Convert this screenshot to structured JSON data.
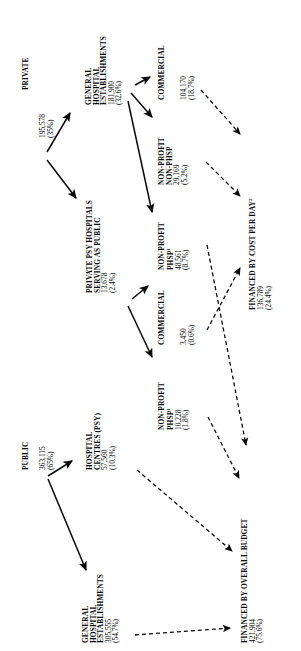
{
  "figure": {
    "type": "flow-diagram",
    "orientation": "text-rotated-90-ccw",
    "background": "#ffffff",
    "ink": "#0a0a0a"
  },
  "nodes": {
    "private": {
      "label": "PRIVATE",
      "value": "195,578",
      "percent": "(35%)"
    },
    "public": {
      "label": "PUBLIC",
      "value": "363,115",
      "percent": "(65%)"
    },
    "private_general_hospital": {
      "line1": "GENERAL",
      "line2": "HOSPITAL",
      "line3": "ESTABLISHMENTS",
      "value": "181,900",
      "percent": "(32.6%)"
    },
    "private_psy_serving_public": {
      "line1": "PRIVATE PSY HOSPITALS",
      "line2": "SERVING AS PUBLIC",
      "value": "13,678",
      "percent": "(2.4%)"
    },
    "public_hospital_centres": {
      "line1": "HOSPITAL",
      "line2": "CENTRES (PSY)",
      "value": "57,560",
      "percent": "(10.3%)"
    },
    "public_general_hospital": {
      "line1": "GENERAL",
      "line2": "HOSPITAL",
      "line3": "ESTABLISHMENTS",
      "value": "305,555",
      "percent": "(54.7%)"
    },
    "commercial_top": {
      "line1": "COMMERCIAL",
      "value": "104,170",
      "percent": "(18.7%)"
    },
    "non_profit_non_phsp": {
      "line1": "NON-PROFIT",
      "line2": "NON-PHSP",
      "value": "29,169",
      "percent": "(5.2%)"
    },
    "non_profit_phsp_upper": {
      "line1": "NON-PROFIT",
      "line2": "PHSP",
      "line2_sup": "1",
      "value": "48,561",
      "percent": "(8.7%)"
    },
    "commercial_mid": {
      "line1": "COMMERCIAL",
      "value": "3,450",
      "percent": "(0.6%)"
    },
    "non_profit_phsp_lower": {
      "line1": "NON-PROFIT",
      "line2": "PHSP",
      "line2_sup": "1",
      "value": "10,228",
      "percent": "(1.8%)"
    },
    "financed_cost_per_day": {
      "line1": "FINANCED BY COST PER DAY",
      "line1_sup": "2",
      "value": "136,789",
      "percent": "(24.4%)"
    },
    "financed_overall_budget": {
      "line1": "FINANCED BY OVERALL BUDGET",
      "value": "421,904",
      "percent": "(75.6%)"
    }
  },
  "edges": [
    {
      "name": "private-to-general-hospital",
      "style": "solid"
    },
    {
      "name": "private-to-psy-serving-public",
      "style": "solid"
    },
    {
      "name": "general-hospital-to-commercial",
      "style": "solid"
    },
    {
      "name": "general-hospital-to-non-profit-non-phsp",
      "style": "solid"
    },
    {
      "name": "general-hospital-to-non-profit-phsp",
      "style": "solid"
    },
    {
      "name": "psy-serving-public-to-commercial-mid",
      "style": "solid"
    },
    {
      "name": "psy-serving-public-to-non-profit-phsp-lower",
      "style": "solid"
    },
    {
      "name": "public-to-hospital-centres",
      "style": "solid"
    },
    {
      "name": "public-to-general-hospital-establishments",
      "style": "solid"
    },
    {
      "name": "commercial-top-to-cost-per-day",
      "style": "dashed"
    },
    {
      "name": "non-profit-non-phsp-to-cost-per-day",
      "style": "dashed"
    },
    {
      "name": "commercial-mid-to-cost-per-day",
      "style": "dashed"
    },
    {
      "name": "non-profit-phsp-upper-to-overall-budget",
      "style": "dashed"
    },
    {
      "name": "non-profit-phsp-lower-to-overall-budget",
      "style": "dashed"
    },
    {
      "name": "hospital-centres-to-overall-budget",
      "style": "dashed"
    },
    {
      "name": "general-hospital-establishments-to-overall-budget",
      "style": "dashed"
    }
  ]
}
